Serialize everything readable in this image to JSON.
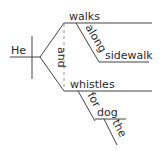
{
  "diagram": {
    "type": "sentence-diagram",
    "subject": "He",
    "conjunction": "and",
    "predicates": [
      {
        "verb": "walks",
        "modifiers": [
          {
            "preposition": "along",
            "object": "sidewalk"
          }
        ]
      },
      {
        "verb": "whistles",
        "modifiers": [
          {
            "preposition": "for",
            "object": "dog",
            "object_modifier": "the"
          }
        ]
      }
    ],
    "colors": {
      "line": "#444444",
      "text": "#2b2b2b",
      "dashed": "#999999",
      "background": "#ffffff"
    }
  }
}
